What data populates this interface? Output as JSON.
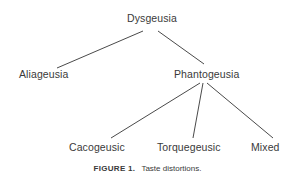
{
  "diagram": {
    "type": "tree",
    "root": {
      "label": "Dysgeusia"
    },
    "nodes": [
      {
        "id": "dysgeusia",
        "label": "Dysgeusia",
        "parent": null
      },
      {
        "id": "aliageusia",
        "label": "Aliageusia",
        "parent": "dysgeusia"
      },
      {
        "id": "phantogeusia",
        "label": "Phantogeusia",
        "parent": "dysgeusia"
      },
      {
        "id": "cacogeusic",
        "label": "Cacogeusic",
        "parent": "phantogeusia"
      },
      {
        "id": "torquegeusic",
        "label": "Torquegeusic",
        "parent": "phantogeusia"
      },
      {
        "id": "mixed",
        "label": "Mixed",
        "parent": "phantogeusia"
      }
    ]
  },
  "caption": {
    "label": "FIGURE 1.",
    "text": "Taste distortions."
  }
}
